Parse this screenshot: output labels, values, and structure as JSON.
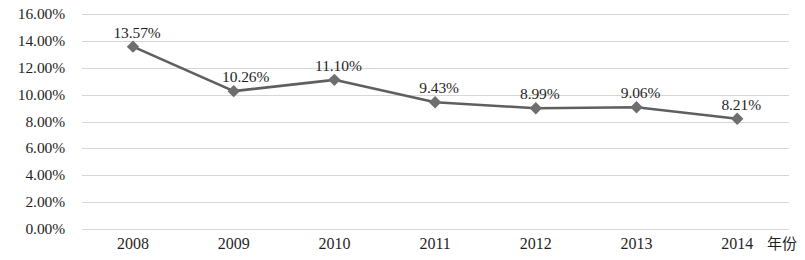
{
  "chart_data": {
    "type": "line",
    "title": "",
    "xlabel": "年份",
    "ylabel": "",
    "categories": [
      "2008",
      "2009",
      "2010",
      "2011",
      "2012",
      "2013",
      "2014"
    ],
    "values": [
      13.57,
      10.26,
      11.1,
      9.43,
      8.99,
      9.06,
      8.21
    ],
    "data_labels": [
      "13.57%",
      "10.26%",
      "11.10%",
      "9.43%",
      "8.99%",
      "9.06%",
      "8.21%"
    ],
    "ylim": [
      0,
      16
    ],
    "ytick_values": [
      0,
      2,
      4,
      6,
      8,
      10,
      12,
      14,
      16
    ],
    "ytick_labels": [
      "0.00%",
      "2.00%",
      "4.00%",
      "6.00%",
      "8.00%",
      "10.00%",
      "12.00%",
      "14.00%",
      "16.00%"
    ],
    "grid": true,
    "grid_axis": "y",
    "legend": false,
    "legend_position": "none",
    "series": [
      {
        "name": "",
        "values": [
          13.57,
          10.26,
          11.1,
          9.43,
          8.99,
          9.06,
          8.21
        ],
        "marker": "diamond",
        "line_color": "#5f5f5f",
        "marker_color": "#6e6e6e"
      }
    ]
  },
  "style": {
    "background": "#ffffff",
    "gridline_color": "#d6d6d6",
    "text_color": "#1f1f1f",
    "line_color": "#5f5f5f",
    "marker_color": "#6e6e6e"
  }
}
